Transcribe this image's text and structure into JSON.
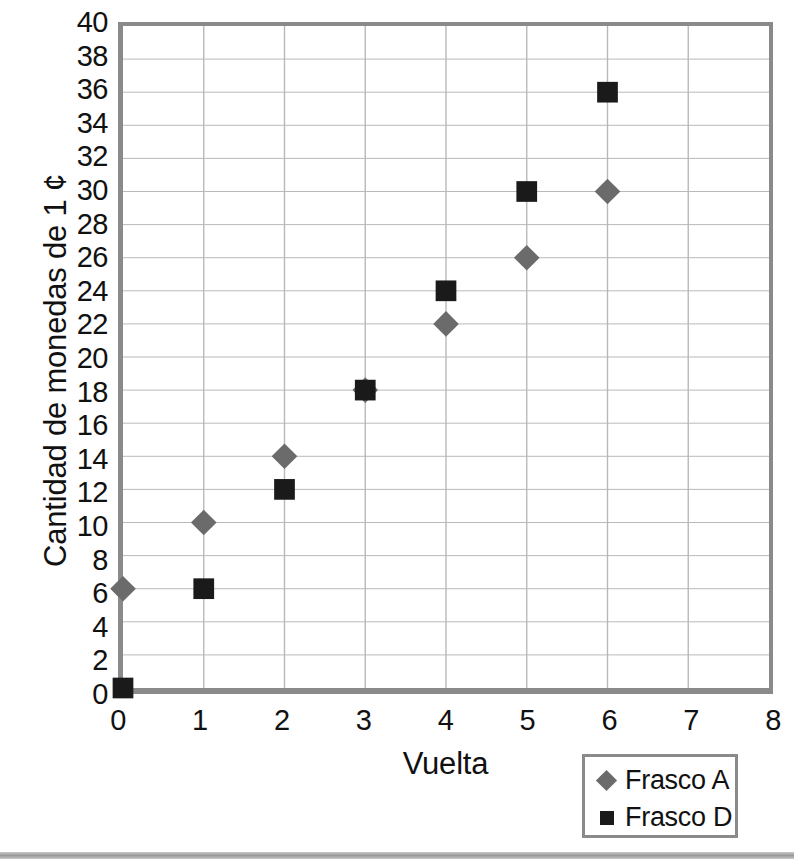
{
  "chart_data": {
    "type": "scatter",
    "title": "",
    "xlabel": "Vuelta",
    "ylabel": "Cantidad de monedas de 1 ¢",
    "xlim": [
      0,
      8
    ],
    "ylim": [
      0,
      40
    ],
    "xtick_step": 1,
    "ytick_step": 2,
    "xticks": [
      "0",
      "1",
      "2",
      "3",
      "4",
      "5",
      "6",
      "7",
      "8"
    ],
    "yticks": [
      "0",
      "2",
      "4",
      "6",
      "8",
      "10",
      "12",
      "14",
      "16",
      "18",
      "20",
      "22",
      "24",
      "26",
      "28",
      "30",
      "32",
      "34",
      "36",
      "38",
      "40"
    ],
    "grid": true,
    "legend_position": "bottom-right",
    "series": [
      {
        "name": "Frasco A",
        "marker": "diamond",
        "color": "#6b6b6b",
        "x": [
          0,
          1,
          2,
          3,
          4,
          5,
          6
        ],
        "values": [
          6,
          10,
          14,
          18,
          22,
          26,
          30
        ]
      },
      {
        "name": "Frasco D",
        "marker": "square",
        "color": "#1a1a1a",
        "x": [
          0,
          1,
          2,
          3,
          4,
          5,
          6
        ],
        "values": [
          0,
          6,
          12,
          18,
          24,
          30,
          36
        ]
      }
    ]
  },
  "legend": {
    "entries": [
      {
        "label": "Frasco A",
        "marker": "diamond"
      },
      {
        "label": "Frasco D",
        "marker": "square"
      }
    ]
  },
  "style": {
    "axis_color": "#8a8a8a",
    "grid_color": "#b8b8b8",
    "text_color": "#111111",
    "background": "#ffffff"
  }
}
